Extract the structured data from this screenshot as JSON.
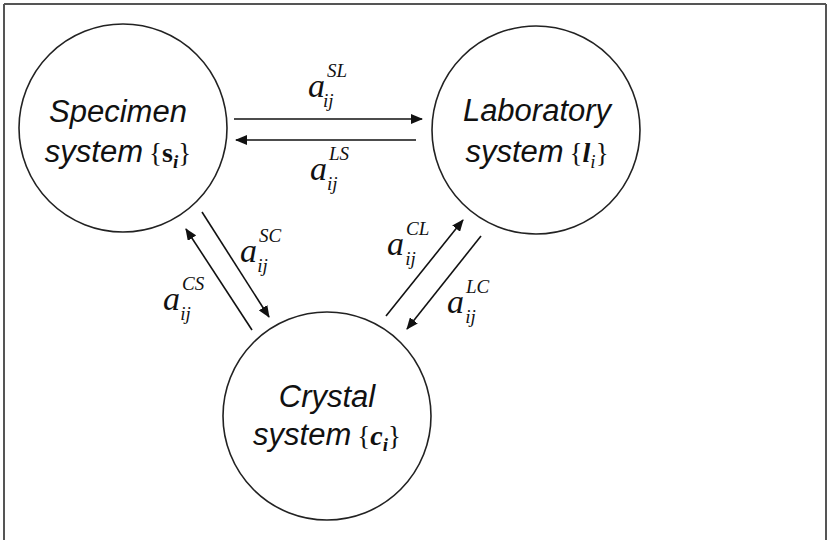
{
  "diagram": {
    "type": "coordinate-transformation-cycle",
    "nodes": [
      {
        "id": "specimen",
        "line1": "Specimen",
        "line2": "system",
        "brace_open": "{",
        "symbol": "s",
        "index": "i",
        "brace_close": "}"
      },
      {
        "id": "laboratory",
        "line1": "Laboratory",
        "line2": "system",
        "brace_open": "{",
        "symbol": "l",
        "index": "i",
        "brace_close": "}"
      },
      {
        "id": "crystal",
        "line1": "Crystal",
        "line2": "system",
        "brace_open": "{",
        "symbol": "c",
        "index": "i",
        "brace_close": "}"
      }
    ],
    "edges": [
      {
        "from": "specimen",
        "to": "laboratory",
        "base": "a",
        "sup": "SL",
        "sub": "ij"
      },
      {
        "from": "laboratory",
        "to": "specimen",
        "base": "a",
        "sup": "LS",
        "sub": "ij"
      },
      {
        "from": "specimen",
        "to": "crystal",
        "base": "a",
        "sup": "SC",
        "sub": "ij"
      },
      {
        "from": "crystal",
        "to": "specimen",
        "base": "a",
        "sup": "CS",
        "sub": "ij"
      },
      {
        "from": "crystal",
        "to": "laboratory",
        "base": "a",
        "sup": "CL",
        "sub": "ij"
      },
      {
        "from": "laboratory",
        "to": "crystal",
        "base": "a",
        "sup": "LC",
        "sub": "ij"
      }
    ],
    "colors": {
      "stroke": "#222222",
      "background": "#ffffff",
      "frame": "#444444"
    }
  }
}
